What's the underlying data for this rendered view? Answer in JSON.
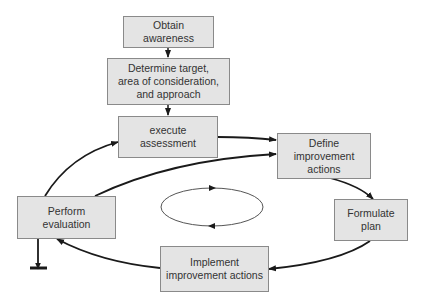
{
  "diagram": {
    "type": "process-cycle-flowchart",
    "nodes": [
      {
        "id": "obtain",
        "label": "Obtain\nawareness"
      },
      {
        "id": "determine",
        "label": "Determine target,\narea of consideration,\nand approach"
      },
      {
        "id": "execute",
        "label": "execute\nassessment"
      },
      {
        "id": "define",
        "label": "Define\nimprovement\nactions"
      },
      {
        "id": "formulate",
        "label": "Formulate\nplan"
      },
      {
        "id": "implement",
        "label": "Implement\nimprovement actions"
      },
      {
        "id": "evaluate",
        "label": "Perform\nevaluation"
      }
    ],
    "edges": [
      {
        "from": "obtain",
        "to": "determine"
      },
      {
        "from": "determine",
        "to": "execute"
      },
      {
        "from": "execute",
        "to": "define"
      },
      {
        "from": "define",
        "to": "formulate"
      },
      {
        "from": "formulate",
        "to": "implement"
      },
      {
        "from": "implement",
        "to": "evaluate"
      },
      {
        "from": "evaluate",
        "to": "execute"
      },
      {
        "from": "evaluate",
        "to": "define"
      },
      {
        "from": "evaluate",
        "to": "terminate"
      }
    ],
    "center_symbol": "clockwise-cycle-ellipse",
    "colors": {
      "box_fill": "#e4e4e4",
      "box_border": "#8a8a8a",
      "arrow": "#1a1a1a",
      "text": "#333333"
    }
  }
}
